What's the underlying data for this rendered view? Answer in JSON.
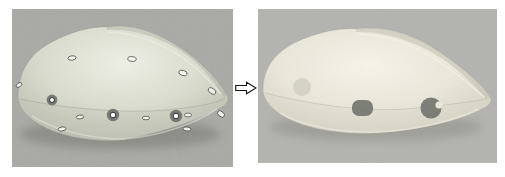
{
  "canvas": {
    "width": 505,
    "height": 177,
    "background": "#ffffff"
  },
  "arrow": {
    "icon": "right-arrow-icon",
    "x": 235,
    "y": 81,
    "width": 22,
    "height": 14,
    "fill": "#ffffff",
    "stroke": "#151515"
  },
  "left_panel": {
    "name": "photo-mouse-shell-with-markers",
    "x": 12,
    "y": 9,
    "width": 221,
    "height": 158,
    "background": "#a9a9a5",
    "shell": {
      "highlight": "#eff0e6",
      "base": "#dadcce",
      "mid": "#bfc2b3",
      "edge": "#a1a498",
      "ground_shadow": "#73736d"
    },
    "markers": {
      "ring_outer": "#6d716b",
      "ring_inner": "#ffffff",
      "ring_inner_stroke": "#1c1c18",
      "flat_fill": "#f6f6f1",
      "flat_stroke": "#45463f",
      "ring": [
        {
          "cx": 40,
          "cy": 91,
          "r": 5.4
        },
        {
          "cx": 101,
          "cy": 106,
          "r": 6.2
        },
        {
          "cx": 164,
          "cy": 107,
          "r": 6.2
        }
      ],
      "flat": [
        {
          "cx": 60,
          "cy": 49,
          "rx": 4.0,
          "ry": 2.2,
          "rot": -8
        },
        {
          "cx": 120,
          "cy": 50,
          "rx": 4.2,
          "ry": 2.4,
          "rot": 4
        },
        {
          "cx": 171,
          "cy": 64,
          "rx": 4.4,
          "ry": 2.6,
          "rot": 18
        },
        {
          "cx": 200,
          "cy": 82,
          "rx": 4.2,
          "ry": 2.6,
          "rot": 34
        },
        {
          "cx": 209,
          "cy": 105,
          "rx": 4.0,
          "ry": 2.5,
          "rot": 40
        },
        {
          "cx": 7,
          "cy": 76,
          "rx": 3.2,
          "ry": 2.0,
          "rot": -35
        },
        {
          "cx": 134,
          "cy": 109,
          "rx": 3.6,
          "ry": 1.8,
          "rot": 0
        },
        {
          "cx": 68,
          "cy": 108,
          "rx": 3.8,
          "ry": 1.9,
          "rot": -6
        },
        {
          "cx": 176,
          "cy": 106,
          "rx": 3.6,
          "ry": 1.9,
          "rot": 0
        },
        {
          "cx": 50,
          "cy": 120,
          "rx": 4.0,
          "ry": 2.0,
          "rot": -10
        },
        {
          "cx": 175,
          "cy": 120,
          "rx": 4.0,
          "ry": 2.0,
          "rot": 8
        }
      ]
    }
  },
  "right_panel": {
    "name": "photo-mouse-shell-markers-removed",
    "x": 258,
    "y": 9,
    "width": 239,
    "height": 154,
    "background": "#b3b3af",
    "shell": {
      "highlight": "#f7f5ea",
      "base": "#eae8da",
      "mid": "#d6d5c6",
      "edge": "#bebeb1",
      "ground_shadow": "#88887f"
    },
    "spots": {
      "spot_color": "#70746e",
      "pad": {
        "x": 94,
        "y": 91,
        "width": 21,
        "height": 16,
        "radius": 7
      },
      "pacman": {
        "cx": 173,
        "cy": 99,
        "r": 10.5,
        "notch": {
          "cx": 181,
          "cy": 96,
          "r": 3.6
        }
      },
      "ghost": {
        "cx": 44,
        "cy": 78,
        "r": 9,
        "fill": "#868b80",
        "opacity": 0.22
      }
    }
  }
}
